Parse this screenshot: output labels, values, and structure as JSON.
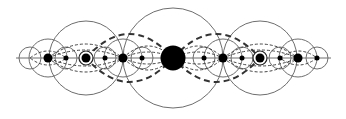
{
  "diagram": {
    "colors": {
      "background": "#ffffff",
      "line": "#6e6e6e",
      "dashed_thin": "#444444",
      "dashed_thick": "#333333",
      "dot": "#000000"
    },
    "axis": {
      "x1": 16,
      "x2": 331,
      "y": 58
    },
    "center_y": 58,
    "dots": [
      {
        "x": 48,
        "r": 4.5
      },
      {
        "x": 66,
        "r": 2.5
      },
      {
        "x": 86,
        "r": 4.5,
        "ring": 7
      },
      {
        "x": 105,
        "r": 2.5
      },
      {
        "x": 123,
        "r": 4.5
      },
      {
        "x": 142,
        "r": 2.5
      },
      {
        "x": 173,
        "r": 12.5
      },
      {
        "x": 204,
        "r": 2.5
      },
      {
        "x": 223,
        "r": 4.5
      },
      {
        "x": 242,
        "r": 2.5
      },
      {
        "x": 260,
        "r": 4.5,
        "ring": 7
      },
      {
        "x": 280,
        "r": 2.5
      },
      {
        "x": 298,
        "r": 4.5
      },
      {
        "x": 317,
        "r": 2.5
      }
    ],
    "circles": [
      {
        "cx": 173,
        "r": 50
      },
      {
        "cx": 86,
        "r": 37
      },
      {
        "cx": 260,
        "r": 37
      },
      {
        "cx": 48,
        "r": 19
      },
      {
        "cx": 298,
        "r": 19
      },
      {
        "cx": 123,
        "r": 19
      },
      {
        "cx": 223,
        "r": 19
      },
      {
        "cx": 30,
        "r": 11
      },
      {
        "cx": 317,
        "r": 11
      },
      {
        "cx": 66,
        "r": 11
      },
      {
        "cx": 105,
        "r": 11
      },
      {
        "cx": 142,
        "r": 11
      },
      {
        "cx": 204,
        "r": 11
      },
      {
        "cx": 242,
        "r": 11
      },
      {
        "cx": 280,
        "r": 11
      }
    ],
    "thick_lenses": [
      {
        "x1": 86,
        "x2": 173,
        "h": 24
      },
      {
        "x1": 173,
        "x2": 260,
        "h": 24
      }
    ],
    "thin_lenses": [
      {
        "x1": 48,
        "x2": 123,
        "h": 14
      },
      {
        "x1": 48,
        "x2": 123,
        "h": 8
      },
      {
        "x1": 123,
        "x2": 173,
        "h": 12
      },
      {
        "x1": 173,
        "x2": 223,
        "h": 12
      },
      {
        "x1": 123,
        "x2": 173,
        "h": 6
      },
      {
        "x1": 173,
        "x2": 223,
        "h": 6
      },
      {
        "x1": 223,
        "x2": 298,
        "h": 14
      },
      {
        "x1": 223,
        "x2": 298,
        "h": 8
      },
      {
        "x1": 30,
        "x2": 66,
        "h": 7
      },
      {
        "x1": 280,
        "x2": 317,
        "h": 7
      }
    ]
  }
}
